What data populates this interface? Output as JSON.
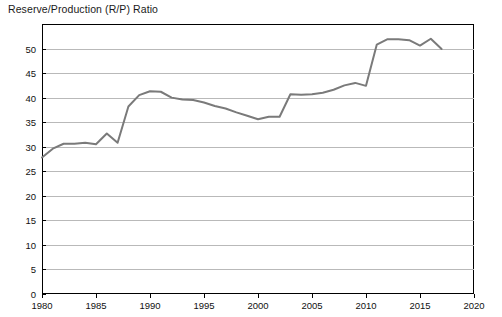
{
  "chart_data": {
    "type": "line",
    "title": "Reserve/Production (R/P) Ratio",
    "xlabel": "",
    "ylabel": "",
    "xlim": [
      1980,
      2020
    ],
    "ylim": [
      0,
      55
    ],
    "yticks": [
      0,
      5,
      10,
      15,
      20,
      25,
      30,
      35,
      40,
      45,
      50
    ],
    "xticks": [
      1980,
      1985,
      1990,
      1995,
      2000,
      2005,
      2010,
      2015,
      2020
    ],
    "grid": "horizontal",
    "legend": "none",
    "line_color": "#7a7a7a",
    "axis_color": "#000000",
    "grid_color": "#b9b9b9",
    "background": "#ffffff",
    "x": [
      1980,
      1981,
      1982,
      1983,
      1984,
      1985,
      1986,
      1987,
      1988,
      1989,
      1990,
      1991,
      1992,
      1993,
      1994,
      1995,
      1996,
      1997,
      1998,
      1999,
      2000,
      2001,
      2002,
      2003,
      2004,
      2005,
      2006,
      2007,
      2008,
      2009,
      2010,
      2011,
      2012,
      2013,
      2014,
      2015,
      2016,
      2017
    ],
    "values": [
      27.8,
      29.6,
      30.6,
      30.6,
      30.8,
      30.5,
      32.7,
      30.8,
      38.2,
      40.5,
      41.3,
      41.2,
      40.0,
      39.6,
      39.5,
      39.0,
      38.3,
      37.8,
      37.0,
      36.3,
      35.6,
      36.1,
      36.1,
      40.7,
      40.6,
      40.7,
      41.0,
      41.6,
      42.5,
      43.0,
      42.4,
      50.8,
      51.9,
      51.9,
      51.7,
      50.6,
      52.0,
      49.9
    ]
  },
  "axis_labels": {
    "y": [
      "0",
      "5",
      "10",
      "15",
      "20",
      "25",
      "30",
      "35",
      "40",
      "45",
      "50"
    ],
    "x": [
      "1980",
      "1985",
      "1990",
      "1995",
      "2000",
      "2005",
      "2010",
      "2015",
      "2020"
    ]
  }
}
